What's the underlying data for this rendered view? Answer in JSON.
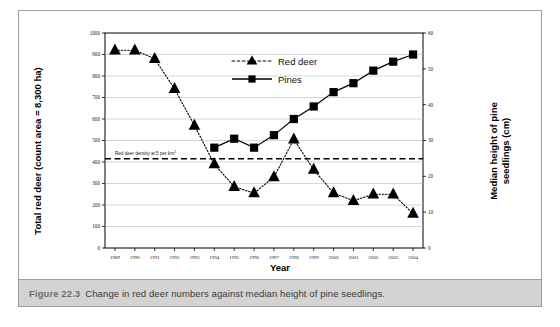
{
  "figure": {
    "caption_label": "Figure 22.3",
    "caption_text": "Change in red deer numbers against median height of pine seedlings."
  },
  "chart_data": {
    "type": "line",
    "title": "",
    "xlabel": "Year",
    "ylabel": "Total red deer (count area = 8,300 ha)",
    "y2label": "Median height of pine seedlings (cm)",
    "categories": [
      "1989",
      "1990",
      "1991",
      "1992",
      "1993",
      "1994",
      "1995",
      "1996",
      "1997",
      "1998",
      "1999",
      "2000",
      "2001",
      "2002",
      "2003",
      "2004"
    ],
    "ylim": [
      0,
      1000
    ],
    "yticks": [
      0,
      100,
      200,
      300,
      400,
      500,
      600,
      700,
      800,
      900,
      1000
    ],
    "y2lim": [
      0,
      60
    ],
    "y2ticks": [
      0,
      10,
      20,
      30,
      40,
      50,
      60
    ],
    "grid": true,
    "legend_position": "top-center",
    "series": [
      {
        "name": "Red deer",
        "axis": "left",
        "marker": "triangle",
        "linestyle": "dotted",
        "color": "#000000",
        "values": [
          920,
          920,
          880,
          740,
          570,
          390,
          285,
          255,
          330,
          505,
          365,
          255,
          220,
          250,
          250,
          160
        ]
      },
      {
        "name": "Pines",
        "axis": "right",
        "marker": "square",
        "linestyle": "solid",
        "color": "#000000",
        "values": [
          null,
          null,
          null,
          null,
          null,
          28,
          30.5,
          28,
          31.5,
          36,
          39.5,
          43.5,
          46,
          49.5,
          52,
          54
        ]
      }
    ],
    "annotations": [
      {
        "name": "reference-line",
        "text": "Red deer density at 5 per km",
        "superscript": "2",
        "axis": "left",
        "value": 415,
        "style": "dashed"
      }
    ]
  },
  "legend": {
    "items": [
      {
        "label": "Red deer",
        "marker": "triangle",
        "linestyle": "dotted"
      },
      {
        "label": "Pines",
        "marker": "square",
        "linestyle": "solid"
      }
    ]
  }
}
